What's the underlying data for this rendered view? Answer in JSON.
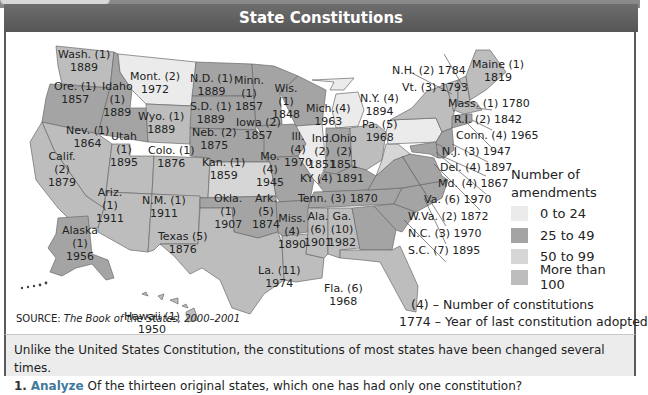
{
  "header": {
    "title": "State Constitutions"
  },
  "colors": {
    "header_bg": "#5e5e5e",
    "amend_0_24": "#ebebeb",
    "amend_25_49": "#a4a4a4",
    "amend_50_99": "#d6d6d6",
    "amend_100_plus": "#bdbdbd",
    "analyze_accent": "#3f7a9c"
  },
  "states": [
    {
      "abbr": "Wash.",
      "constitutions": 1,
      "year": 1889
    },
    {
      "abbr": "Ore.",
      "constitutions": 1,
      "year": 1857
    },
    {
      "abbr": "Idaho",
      "constitutions": 1,
      "year": 1889
    },
    {
      "abbr": "Mont.",
      "constitutions": 2,
      "year": 1972
    },
    {
      "abbr": "N.D.",
      "constitutions": 1,
      "year": 1889
    },
    {
      "abbr": "Minn.",
      "constitutions": 1,
      "year": 1857
    },
    {
      "abbr": "Wis.",
      "constitutions": 1,
      "year": 1848
    },
    {
      "abbr": "Mich.",
      "constitutions": 4,
      "year": 1963
    },
    {
      "abbr": "S.D.",
      "constitutions": 1,
      "year": 1889
    },
    {
      "abbr": "Wyo.",
      "constitutions": 1,
      "year": 1889
    },
    {
      "abbr": "Nev.",
      "constitutions": 1,
      "year": 1864
    },
    {
      "abbr": "Utah",
      "constitutions": 1,
      "year": 1895
    },
    {
      "abbr": "Calif.",
      "constitutions": 2,
      "year": 1879
    },
    {
      "abbr": "Colo.",
      "constitutions": 1,
      "year": 1876
    },
    {
      "abbr": "Neb.",
      "constitutions": 2,
      "year": 1875
    },
    {
      "abbr": "Iowa",
      "constitutions": 2,
      "year": 1857
    },
    {
      "abbr": "Ill.",
      "constitutions": 4,
      "year": 1970
    },
    {
      "abbr": "Ind.",
      "constitutions": 2,
      "year": 1851
    },
    {
      "abbr": "Ohio",
      "constitutions": 2,
      "year": 1851
    },
    {
      "abbr": "Pa.",
      "constitutions": 5,
      "year": 1968
    },
    {
      "abbr": "N.Y.",
      "constitutions": 4,
      "year": 1894
    },
    {
      "abbr": "Kan.",
      "constitutions": 1,
      "year": 1859
    },
    {
      "abbr": "Mo.",
      "constitutions": 4,
      "year": 1945
    },
    {
      "abbr": "KY",
      "constitutions": 4,
      "year": 1891
    },
    {
      "abbr": "Ariz.",
      "constitutions": 1,
      "year": 1911
    },
    {
      "abbr": "N.M.",
      "constitutions": 1,
      "year": 1911
    },
    {
      "abbr": "Okla.",
      "constitutions": 1,
      "year": 1907
    },
    {
      "abbr": "Ark.",
      "constitutions": 5,
      "year": 1874
    },
    {
      "abbr": "Tenn.",
      "constitutions": 3,
      "year": 1870
    },
    {
      "abbr": "Texas",
      "constitutions": 5,
      "year": 1876
    },
    {
      "abbr": "Miss.",
      "constitutions": 4,
      "year": 1890
    },
    {
      "abbr": "Ala.",
      "constitutions": 6,
      "year": 1901
    },
    {
      "abbr": "Ga.",
      "constitutions": 10,
      "year": 1982
    },
    {
      "abbr": "La.",
      "constitutions": 11,
      "year": 1974
    },
    {
      "abbr": "Fla.",
      "constitutions": 6,
      "year": 1968
    },
    {
      "abbr": "Alaska",
      "constitutions": 1,
      "year": 1956
    },
    {
      "abbr": "Hawaii",
      "constitutions": 1,
      "year": 1950
    },
    {
      "abbr": "Maine",
      "constitutions": 1,
      "year": 1819
    },
    {
      "abbr": "N.H.",
      "constitutions": 2,
      "year": 1784
    },
    {
      "abbr": "Vt.",
      "constitutions": 3,
      "year": 1793
    },
    {
      "abbr": "Mass.",
      "constitutions": 1,
      "year": 1780
    },
    {
      "abbr": "R.I.",
      "constitutions": 2,
      "year": 1842
    },
    {
      "abbr": "Conn.",
      "constitutions": 4,
      "year": 1965
    },
    {
      "abbr": "N.J.",
      "constitutions": 3,
      "year": 1947
    },
    {
      "abbr": "Del.",
      "constitutions": 4,
      "year": 1897
    },
    {
      "abbr": "Md.",
      "constitutions": 4,
      "year": 1867
    },
    {
      "abbr": "Va.",
      "constitutions": 6,
      "year": 1970
    },
    {
      "abbr": "W.Va.",
      "constitutions": 2,
      "year": 1872
    },
    {
      "abbr": "N.C.",
      "constitutions": 3,
      "year": 1970
    },
    {
      "abbr": "S.C.",
      "constitutions": 7,
      "year": 1895
    }
  ],
  "labels": {
    "wash": [
      "Wash. (1)",
      "1889"
    ],
    "ore": [
      "Ore. (1)",
      "1857"
    ],
    "idaho": [
      "Idaho",
      "(1)",
      "1889"
    ],
    "mont": [
      "Mont. (2)",
      "1972"
    ],
    "nd": [
      "N.D. (1)",
      "1889"
    ],
    "minn": [
      "Minn.",
      "(1)",
      "1857"
    ],
    "wis": [
      "Wis.",
      "(1)",
      "1848"
    ],
    "mich": [
      "Mich.(4)",
      "1963"
    ],
    "sd": [
      "S.D. (1)",
      "1889"
    ],
    "wyo": [
      "Wyo. (1)",
      "1889"
    ],
    "nev": [
      "Nev. (1)",
      "1864"
    ],
    "utah": [
      "Utah",
      "(1)",
      "1895"
    ],
    "calif": [
      "Calif.",
      "(2)",
      "1879"
    ],
    "colo": [
      "Colo. (1)",
      "1876"
    ],
    "neb": [
      "Neb. (2)",
      "1875"
    ],
    "iowa": [
      "Iowa (2)",
      "1857"
    ],
    "ill": [
      "Ill.",
      "(4)",
      "1970"
    ],
    "ind": [
      "Ind.",
      "(2)",
      "1851"
    ],
    "ohio": [
      "Ohio",
      "(2)",
      "1851"
    ],
    "pa": [
      "Pa. (5)",
      "1968"
    ],
    "ny": [
      "N.Y. (4)",
      "1894"
    ],
    "kan": [
      "Kan. (1)",
      "1859"
    ],
    "mo": [
      "Mo.",
      "(4)",
      "1945"
    ],
    "ky": "KY (4) 1891",
    "ariz": [
      "Ariz.",
      "(1)",
      "1911"
    ],
    "nm": [
      "N.M. (1)",
      "1911"
    ],
    "okla": [
      "Okla.",
      "(1)",
      "1907"
    ],
    "ark": [
      "Ark.",
      "(5)",
      "1874"
    ],
    "tenn": "Tenn. (3) 1870",
    "texas": [
      "Texas (5)",
      "1876"
    ],
    "miss": [
      "Miss.",
      "(4)",
      "1890"
    ],
    "ala": [
      "Ala.",
      "(6)",
      "1901"
    ],
    "ga": [
      "Ga.",
      "(10)",
      "1982"
    ],
    "la": [
      "La. (11)",
      "1974"
    ],
    "fla": [
      "Fla. (6)",
      "1968"
    ],
    "alaska": [
      "Alaska",
      "(1)",
      "1956"
    ],
    "hawaii": [
      "Hawaii (1)",
      "1950"
    ],
    "maine": [
      "Maine (1)",
      "1819"
    ],
    "nh": "N.H. (2) 1784",
    "vt": "Vt. (3) 1793",
    "mass": "Mass. (1) 1780",
    "ri": "R.I. (2) 1842",
    "conn": "Conn. (4) 1965",
    "nj": "N.J. (3) 1947",
    "del": "Del. (4) 1897",
    "md": "Md. (4) 1867",
    "va": "Va. (6) 1970",
    "wva": "W.Va. (2) 1872",
    "nc": "N.C. (3) 1970",
    "sc": "S.C. (7) 1895"
  },
  "legend": {
    "title_line1": "Number of",
    "title_line2": "amendments",
    "items": [
      {
        "label": "0 to 24",
        "color": "#ebebeb"
      },
      {
        "label": "25 to 49",
        "color": "#a4a4a4"
      },
      {
        "label": "50 to 99",
        "color": "#d6d6d6"
      },
      {
        "label": "More than 100",
        "color": "#bdbdbd"
      }
    ]
  },
  "key": {
    "constitutions": "(4) – Number of constitutions",
    "year": "1774 – Year of last constitution adopted"
  },
  "source": {
    "prefix": "SOURCE: ",
    "title": "The Book of the States, 2000–2001"
  },
  "footer": {
    "intro": "Unlike the United States Constitution, the constitutions of most states have been changed several times.",
    "question_number": "1.",
    "question_keyword": "Analyze",
    "question_text": "Of the thirteen original states, which one has had only one constitution?"
  }
}
